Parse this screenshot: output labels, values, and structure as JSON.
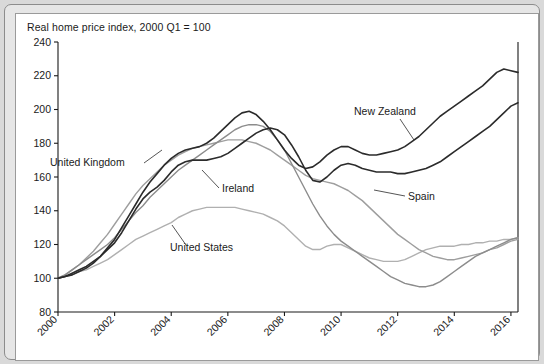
{
  "chart_data": {
    "type": "line",
    "title": "Real home price index, 2000 Q1 = 100",
    "xlabel": "",
    "ylabel": "",
    "xlim": [
      2000,
      2016.25
    ],
    "ylim": [
      80,
      240
    ],
    "ytick_step": 20,
    "xtick_step": 2,
    "grid": false,
    "legend_position": "inline-annotations",
    "yticks": [
      "80",
      "100",
      "120",
      "140",
      "160",
      "180",
      "200",
      "220",
      "240"
    ],
    "xticks": [
      "2000",
      "2002",
      "2004",
      "2006",
      "2008",
      "2010",
      "2012",
      "2014",
      "2016"
    ],
    "annotations": [
      {
        "text": "United Kingdom",
        "series": "United Kingdom"
      },
      {
        "text": "Ireland",
        "series": "Ireland"
      },
      {
        "text": "United States",
        "series": "United States"
      },
      {
        "text": "New Zealand",
        "series": "New Zealand"
      },
      {
        "text": "Spain",
        "series": "Spain"
      }
    ],
    "x": [
      2000,
      2000.25,
      2000.5,
      2000.75,
      2001,
      2001.25,
      2001.5,
      2001.75,
      2002,
      2002.25,
      2002.5,
      2002.75,
      2003,
      2003.25,
      2003.5,
      2003.75,
      2004,
      2004.25,
      2004.5,
      2004.75,
      2005,
      2005.25,
      2005.5,
      2005.75,
      2006,
      2006.25,
      2006.5,
      2006.75,
      2007,
      2007.25,
      2007.5,
      2007.75,
      2008,
      2008.25,
      2008.5,
      2008.75,
      2009,
      2009.25,
      2009.5,
      2009.75,
      2010,
      2010.25,
      2010.5,
      2010.75,
      2011,
      2011.25,
      2011.5,
      2011.75,
      2012,
      2012.25,
      2012.5,
      2012.75,
      2013,
      2013.25,
      2013.5,
      2013.75,
      2014,
      2014.25,
      2014.5,
      2014.75,
      2015,
      2015.25,
      2015.5,
      2015.75,
      2016,
      2016.25
    ],
    "series": [
      {
        "name": "United Kingdom",
        "color": "#2b2b2b",
        "width": 1.6,
        "values": [
          100,
          101,
          103,
          105,
          107,
          110,
          113,
          117,
          121,
          127,
          134,
          141,
          147,
          151,
          154,
          158,
          163,
          167,
          169,
          170,
          170,
          170,
          171,
          172,
          174,
          177,
          180,
          183,
          186,
          188,
          189,
          188,
          185,
          179,
          172,
          164,
          158,
          157,
          160,
          164,
          167,
          168,
          167,
          165,
          164,
          163,
          163,
          163,
          162,
          162,
          163,
          164,
          165,
          167,
          169,
          172,
          175,
          178,
          181,
          184,
          187,
          190,
          194,
          198,
          202,
          204
        ]
      },
      {
        "name": "New Zealand",
        "color": "#2b2b2b",
        "width": 1.6,
        "values": [
          100,
          101,
          102,
          104,
          106,
          109,
          113,
          118,
          123,
          130,
          137,
          144,
          151,
          157,
          162,
          167,
          171,
          174,
          176,
          177,
          178,
          180,
          183,
          187,
          191,
          195,
          198,
          199,
          197,
          193,
          188,
          182,
          176,
          171,
          167,
          165,
          166,
          169,
          173,
          176,
          178,
          178,
          176,
          174,
          173,
          173,
          174,
          175,
          176,
          178,
          181,
          184,
          188,
          192,
          196,
          199,
          202,
          205,
          208,
          211,
          214,
          218,
          222,
          224,
          223,
          222
        ]
      },
      {
        "name": "Ireland",
        "color": "#8c8c8c",
        "width": 1.4,
        "values": [
          100,
          102,
          105,
          108,
          111,
          114,
          117,
          120,
          124,
          129,
          134,
          139,
          143,
          148,
          152,
          156,
          160,
          164,
          167,
          170,
          173,
          176,
          179,
          182,
          185,
          188,
          190,
          191,
          191,
          190,
          187,
          182,
          176,
          168,
          160,
          152,
          144,
          137,
          131,
          126,
          122,
          119,
          116,
          113,
          110,
          107,
          104,
          101,
          99,
          97,
          96,
          95,
          95,
          96,
          98,
          101,
          104,
          107,
          110,
          113,
          115,
          117,
          119,
          121,
          123,
          124
        ]
      },
      {
        "name": "Spain",
        "color": "#9e9e9e",
        "width": 1.4,
        "values": [
          100,
          102,
          105,
          108,
          112,
          116,
          121,
          126,
          132,
          138,
          144,
          150,
          155,
          159,
          163,
          167,
          170,
          173,
          175,
          177,
          178,
          179,
          180,
          181,
          182,
          182,
          182,
          181,
          180,
          178,
          176,
          173,
          170,
          167,
          164,
          161,
          159,
          158,
          157,
          156,
          154,
          152,
          149,
          146,
          142,
          138,
          134,
          130,
          126,
          123,
          120,
          117,
          115,
          113,
          112,
          111,
          111,
          112,
          113,
          114,
          115,
          117,
          118,
          120,
          122,
          123
        ]
      },
      {
        "name": "United States",
        "color": "#b0b0b0",
        "width": 1.4,
        "values": [
          100,
          101,
          102,
          104,
          105,
          107,
          109,
          111,
          114,
          117,
          120,
          123,
          125,
          127,
          129,
          131,
          133,
          136,
          138,
          140,
          141,
          142,
          142,
          142,
          142,
          142,
          141,
          140,
          139,
          138,
          136,
          134,
          131,
          127,
          123,
          119,
          117,
          117,
          119,
          120,
          120,
          118,
          116,
          114,
          112,
          111,
          110,
          110,
          110,
          111,
          113,
          115,
          117,
          118,
          119,
          119,
          119,
          120,
          120,
          121,
          121,
          122,
          122,
          123,
          123,
          124
        ]
      }
    ]
  },
  "labels": {
    "united_kingdom": "United Kingdom",
    "ireland": "Ireland",
    "united_states": "United States",
    "new_zealand": "New Zealand",
    "spain": "Spain"
  }
}
